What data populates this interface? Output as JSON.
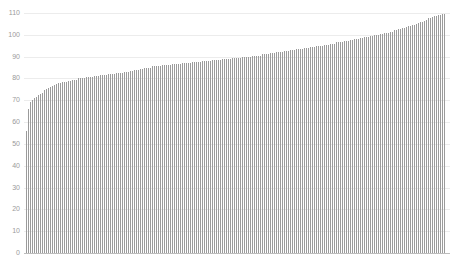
{
  "chart_data": {
    "type": "bar",
    "title": "",
    "xlabel": "",
    "ylabel": "",
    "ylim": [
      0,
      110
    ],
    "yticks": [
      0,
      10,
      20,
      30,
      40,
      50,
      60,
      70,
      80,
      90,
      100,
      110
    ],
    "grid": true,
    "legend": null,
    "sorted": "ascending",
    "bar_color": "#9b9b9b",
    "grid_color": "#ececec",
    "n_bars": 210,
    "profile_points": [
      {
        "index": 0,
        "value": 56
      },
      {
        "index": 1,
        "value": 66
      },
      {
        "index": 2,
        "value": 69
      },
      {
        "index": 4,
        "value": 71
      },
      {
        "index": 7,
        "value": 73
      },
      {
        "index": 10,
        "value": 75
      },
      {
        "index": 15,
        "value": 77.5
      },
      {
        "index": 19,
        "value": 78.5
      },
      {
        "index": 24,
        "value": 79.5
      },
      {
        "index": 35,
        "value": 81
      },
      {
        "index": 50,
        "value": 83
      },
      {
        "index": 60,
        "value": 85
      },
      {
        "index": 80,
        "value": 87
      },
      {
        "index": 100,
        "value": 89
      },
      {
        "index": 120,
        "value": 91
      },
      {
        "index": 140,
        "value": 94
      },
      {
        "index": 160,
        "value": 97
      },
      {
        "index": 175,
        "value": 100
      },
      {
        "index": 185,
        "value": 102
      },
      {
        "index": 195,
        "value": 105
      },
      {
        "index": 203,
        "value": 108
      },
      {
        "index": 209,
        "value": 109.5
      }
    ]
  },
  "axis": {
    "labels": [
      "0",
      "10",
      "20",
      "30",
      "40",
      "50",
      "60",
      "70",
      "80",
      "90",
      "100",
      "110"
    ]
  }
}
